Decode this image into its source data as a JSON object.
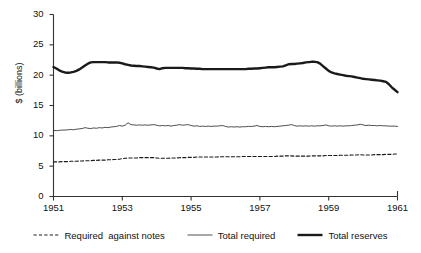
{
  "chart_data": {
    "type": "line",
    "title": "",
    "xlabel": "",
    "ylabel": "$ (billions)",
    "xlim": [
      1951,
      1961
    ],
    "ylim": [
      0,
      30
    ],
    "grid": false,
    "legend_position": "bottom",
    "x_tick_labels": [
      "1951",
      "1953",
      "1955",
      "1957",
      "1959",
      "1961"
    ],
    "x_tick_values": [
      1951,
      1953,
      1955,
      1957,
      1959,
      1961
    ],
    "y_tick_labels": [
      "0",
      "5",
      "10",
      "15",
      "20",
      "25",
      "30"
    ],
    "y_tick_values": [
      0,
      5,
      10,
      15,
      20,
      25,
      30
    ],
    "x": [
      1951.0,
      1951.083,
      1951.167,
      1951.25,
      1951.333,
      1951.417,
      1951.5,
      1951.583,
      1951.667,
      1951.75,
      1951.833,
      1951.917,
      1952.0,
      1952.083,
      1952.167,
      1952.25,
      1952.333,
      1952.417,
      1952.5,
      1952.583,
      1952.667,
      1952.75,
      1952.833,
      1952.917,
      1953.0,
      1953.083,
      1953.167,
      1953.25,
      1953.333,
      1953.417,
      1953.5,
      1953.583,
      1953.667,
      1953.75,
      1953.833,
      1953.917,
      1954.0,
      1954.083,
      1954.167,
      1954.25,
      1954.333,
      1954.417,
      1954.5,
      1954.583,
      1954.667,
      1954.75,
      1954.833,
      1954.917,
      1955.0,
      1955.083,
      1955.167,
      1955.25,
      1955.333,
      1955.417,
      1955.5,
      1955.583,
      1955.667,
      1955.75,
      1955.833,
      1955.917,
      1956.0,
      1956.083,
      1956.167,
      1956.25,
      1956.333,
      1956.417,
      1956.5,
      1956.583,
      1956.667,
      1956.75,
      1956.833,
      1956.917,
      1957.0,
      1957.083,
      1957.167,
      1957.25,
      1957.333,
      1957.417,
      1957.5,
      1957.583,
      1957.667,
      1957.75,
      1957.833,
      1957.917,
      1958.0,
      1958.083,
      1958.167,
      1958.25,
      1958.333,
      1958.417,
      1958.5,
      1958.583,
      1958.667,
      1958.75,
      1958.833,
      1958.917,
      1959.0,
      1959.083,
      1959.167,
      1959.25,
      1959.333,
      1959.417,
      1959.5,
      1959.583,
      1959.667,
      1959.75,
      1959.833,
      1959.917,
      1960.0,
      1960.083,
      1960.167,
      1960.25,
      1960.333,
      1960.417,
      1960.5,
      1960.583,
      1960.667,
      1960.75,
      1960.833,
      1960.917,
      1961.0
    ],
    "series": [
      {
        "name": "Total reserves",
        "style": "solid-thick",
        "color": "#1a1a1a",
        "width": 2.4,
        "values": [
          21.35,
          21.1,
          20.8,
          20.6,
          20.45,
          20.4,
          20.45,
          20.55,
          20.7,
          20.95,
          21.25,
          21.6,
          21.9,
          22.1,
          22.15,
          22.15,
          22.15,
          22.15,
          22.15,
          22.1,
          22.1,
          22.1,
          22.1,
          22.05,
          21.95,
          21.8,
          21.7,
          21.6,
          21.55,
          21.5,
          21.5,
          21.45,
          21.4,
          21.35,
          21.3,
          21.25,
          21.1,
          21.0,
          21.15,
          21.2,
          21.2,
          21.2,
          21.2,
          21.2,
          21.2,
          21.2,
          21.15,
          21.15,
          21.1,
          21.1,
          21.05,
          21.05,
          21.0,
          21.0,
          21.0,
          21.0,
          21.0,
          21.0,
          21.0,
          21.0,
          21.0,
          21.0,
          21.0,
          21.0,
          21.0,
          21.0,
          21.0,
          21.0,
          21.05,
          21.05,
          21.1,
          21.1,
          21.15,
          21.2,
          21.25,
          21.3,
          21.3,
          21.3,
          21.35,
          21.4,
          21.45,
          21.6,
          21.8,
          21.85,
          21.85,
          21.9,
          21.95,
          22.0,
          22.1,
          22.15,
          22.2,
          22.2,
          22.15,
          21.9,
          21.5,
          21.1,
          20.7,
          20.45,
          20.3,
          20.2,
          20.1,
          20.0,
          19.9,
          19.85,
          19.8,
          19.7,
          19.6,
          19.5,
          19.4,
          19.35,
          19.3,
          19.25,
          19.2,
          19.15,
          19.1,
          19.0,
          18.9,
          18.5,
          18.0,
          17.6,
          17.2
        ]
      },
      {
        "name": "Total required",
        "style": "solid-thin",
        "color": "#3a3a3a",
        "width": 0.9,
        "values": [
          10.9,
          10.85,
          10.9,
          10.95,
          10.95,
          11.0,
          11.05,
          11.0,
          11.1,
          11.15,
          11.2,
          11.35,
          11.25,
          11.2,
          11.3,
          11.25,
          11.35,
          11.3,
          11.4,
          11.35,
          11.45,
          11.5,
          11.55,
          11.7,
          11.6,
          11.75,
          12.15,
          11.85,
          11.8,
          11.75,
          11.8,
          11.75,
          11.8,
          11.75,
          11.8,
          11.85,
          11.75,
          11.65,
          11.7,
          11.65,
          11.7,
          11.6,
          11.7,
          11.75,
          11.85,
          11.75,
          11.8,
          11.85,
          11.7,
          11.6,
          11.65,
          11.55,
          11.6,
          11.55,
          11.6,
          11.55,
          11.6,
          11.6,
          11.65,
          11.7,
          11.55,
          11.45,
          11.5,
          11.45,
          11.5,
          11.45,
          11.5,
          11.5,
          11.55,
          11.55,
          11.6,
          11.7,
          11.55,
          11.5,
          11.55,
          11.5,
          11.55,
          11.5,
          11.55,
          11.6,
          11.65,
          11.7,
          11.75,
          11.85,
          11.7,
          11.6,
          11.65,
          11.6,
          11.65,
          11.6,
          11.65,
          11.6,
          11.65,
          11.65,
          11.7,
          11.8,
          11.65,
          11.6,
          11.65,
          11.6,
          11.65,
          11.6,
          11.65,
          11.65,
          11.7,
          11.75,
          11.8,
          11.9,
          11.8,
          11.7,
          11.75,
          11.7,
          11.7,
          11.65,
          11.7,
          11.65,
          11.65,
          11.6,
          11.6,
          11.6,
          11.55
        ]
      },
      {
        "name": "Required  against notes",
        "style": "dashed",
        "color": "#1a1a1a",
        "width": 1.1,
        "values": [
          5.7,
          5.7,
          5.7,
          5.75,
          5.75,
          5.75,
          5.8,
          5.8,
          5.8,
          5.85,
          5.85,
          5.9,
          5.9,
          5.9,
          5.95,
          5.95,
          6.0,
          6.0,
          6.0,
          6.05,
          6.05,
          6.1,
          6.1,
          6.15,
          6.25,
          6.3,
          6.35,
          6.35,
          6.35,
          6.35,
          6.4,
          6.4,
          6.4,
          6.4,
          6.4,
          6.4,
          6.35,
          6.3,
          6.3,
          6.3,
          6.3,
          6.35,
          6.35,
          6.35,
          6.4,
          6.4,
          6.4,
          6.45,
          6.45,
          6.45,
          6.5,
          6.5,
          6.5,
          6.5,
          6.5,
          6.5,
          6.5,
          6.5,
          6.55,
          6.55,
          6.55,
          6.55,
          6.55,
          6.55,
          6.55,
          6.55,
          6.6,
          6.6,
          6.6,
          6.6,
          6.6,
          6.6,
          6.6,
          6.6,
          6.6,
          6.6,
          6.6,
          6.6,
          6.65,
          6.65,
          6.65,
          6.7,
          6.7,
          6.7,
          6.65,
          6.65,
          6.65,
          6.65,
          6.65,
          6.65,
          6.7,
          6.7,
          6.7,
          6.7,
          6.7,
          6.75,
          6.75,
          6.75,
          6.75,
          6.75,
          6.8,
          6.8,
          6.8,
          6.8,
          6.85,
          6.85,
          6.85,
          6.9,
          6.85,
          6.85,
          6.85,
          6.85,
          6.9,
          6.9,
          6.9,
          6.9,
          6.95,
          6.95,
          6.95,
          7.0,
          7.0
        ]
      }
    ]
  },
  "legend": {
    "entries": [
      {
        "label": "Required  against notes"
      },
      {
        "label": "Total required"
      },
      {
        "label": "Total reserves"
      }
    ]
  },
  "axes": {
    "y_title": "$ (billions)"
  }
}
